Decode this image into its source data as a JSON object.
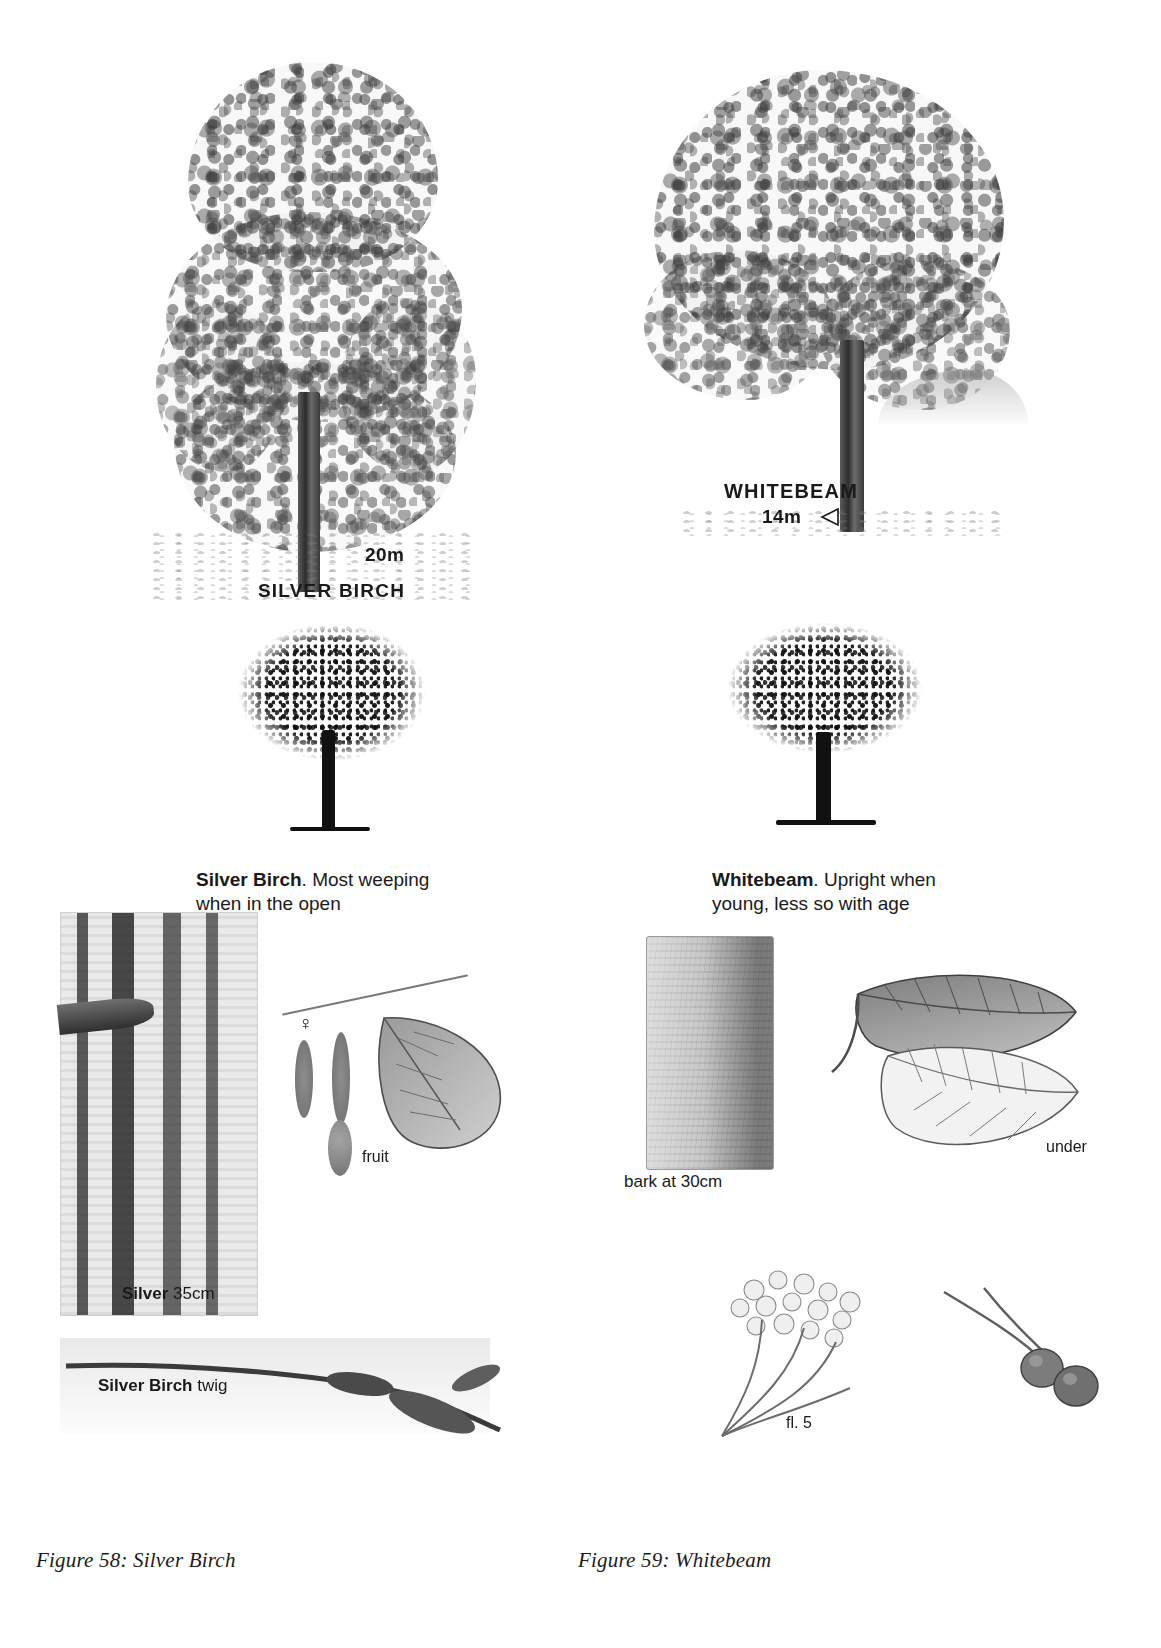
{
  "page": {
    "background": "#ffffff",
    "width": 1161,
    "height": 1648
  },
  "left_panel": {
    "species": "Silver Birch",
    "tree_portrait": {
      "height_label": "20m",
      "name_label": "SILVER BIRCH"
    },
    "silhouette_caption": {
      "bold": "Silver Birch",
      "rest": ". Most weeping",
      "line2": "when in the open"
    },
    "bark_label": {
      "bold": "Silver",
      "rest": "35cm"
    },
    "fruit_label": "fruit",
    "female_symbol": "♀",
    "twig_label": {
      "bold": "Silver Birch",
      "rest": "twig"
    },
    "figure_caption": "Figure 58: Silver Birch"
  },
  "right_panel": {
    "species": "Whitebeam",
    "tree_portrait": {
      "name_label": "WHITEBEAM",
      "height_label": "14m",
      "marker": "left-triangle"
    },
    "silhouette_caption": {
      "bold": "Whitebeam",
      "rest": ". Upright when",
      "line2": "young, less so with age"
    },
    "bark_label": "bark at 30cm",
    "leaf_underside_label": "under",
    "flower_label": "fl. 5",
    "figure_caption": "Figure 59: Whitebeam"
  },
  "colors": {
    "ink": "#1a1a1a",
    "paper": "#ffffff",
    "pencil_mid": "#6b6b6b",
    "pencil_dark": "#2d2d2d",
    "bark_light": "#e9e9e6"
  }
}
